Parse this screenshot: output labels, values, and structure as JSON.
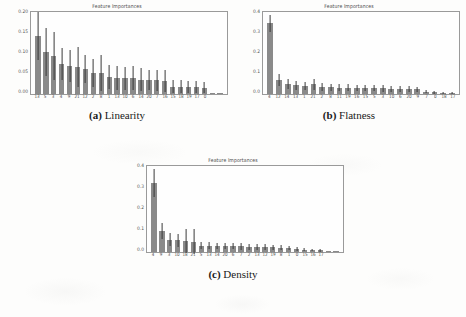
{
  "figure": {
    "background_color": "#fdfdfc",
    "bar_color": "#8a8a8a",
    "error_bar_color": "#3a3a3a",
    "axes_border_color": "#9a9a9a"
  },
  "panels": [
    {
      "id": "a",
      "caption_label": "(a)",
      "caption_text": "Linearity",
      "chart_data": {
        "type": "bar",
        "title": "Feature Importances",
        "xlabel": "",
        "ylabel": "",
        "ylim": [
          0.0,
          0.21
        ],
        "yticks": [
          "0.00",
          "0.05",
          "0.10",
          "0.15",
          "0.20"
        ],
        "ytick_values": [
          0.0,
          0.05,
          0.1,
          0.15,
          0.2
        ],
        "grid": false,
        "legend": "none",
        "categories": [
          "13",
          "5",
          "3",
          "4",
          "9",
          "21",
          "12",
          "2",
          "8",
          "1",
          "13",
          "10",
          "6",
          "14",
          "20",
          "7",
          "16",
          "15",
          "18",
          "19",
          "17",
          "0"
        ],
        "values": [
          0.148,
          0.107,
          0.098,
          0.076,
          0.072,
          0.07,
          0.063,
          0.055,
          0.054,
          0.044,
          0.042,
          0.04,
          0.04,
          0.037,
          0.036,
          0.035,
          0.034,
          0.019,
          0.019,
          0.018,
          0.018,
          0.016
        ],
        "errors": [
          0.06,
          0.06,
          0.06,
          0.04,
          0.04,
          0.05,
          0.035,
          0.035,
          0.045,
          0.03,
          0.03,
          0.028,
          0.03,
          0.028,
          0.026,
          0.026,
          0.028,
          0.016,
          0.016,
          0.016,
          0.016,
          0.014
        ],
        "tail_values": [
          0.002,
          0.002
        ]
      }
    },
    {
      "id": "b",
      "caption_label": "(b)",
      "caption_text": "Flatness",
      "chart_data": {
        "type": "bar",
        "title": "Feature Importances",
        "xlabel": "",
        "ylabel": "",
        "ylim": [
          0.0,
          0.43
        ],
        "yticks": [
          "0.0",
          "0.1",
          "0.2",
          "0.3",
          "0.4"
        ],
        "ytick_values": [
          0.0,
          0.1,
          0.2,
          0.3,
          0.4
        ],
        "grid": false,
        "legend": "none",
        "categories": [
          "4",
          "12",
          "14",
          "13",
          "1",
          "21",
          "2",
          "8",
          "11",
          "19",
          "16",
          "15",
          "5",
          "3",
          "10",
          "6",
          "20",
          "9",
          "7",
          "0",
          "18",
          "17"
        ],
        "values": [
          0.37,
          0.075,
          0.052,
          0.045,
          0.042,
          0.05,
          0.038,
          0.035,
          0.034,
          0.033,
          0.032,
          0.031,
          0.03,
          0.029,
          0.028,
          0.027,
          0.026,
          0.024,
          0.012,
          0.008,
          0.006,
          0.004
        ],
        "errors": [
          0.045,
          0.03,
          0.025,
          0.022,
          0.022,
          0.026,
          0.02,
          0.018,
          0.018,
          0.018,
          0.017,
          0.017,
          0.016,
          0.016,
          0.015,
          0.015,
          0.014,
          0.013,
          0.008,
          0.006,
          0.005,
          0.004
        ],
        "tail_values": []
      }
    },
    {
      "id": "c",
      "caption_label": "(c)",
      "caption_text": "Density",
      "chart_data": {
        "type": "bar",
        "title": "Feature Importances",
        "xlabel": "",
        "ylabel": "",
        "ylim": [
          0.0,
          0.43
        ],
        "yticks": [
          "0.0",
          "0.1",
          "0.2",
          "0.3",
          "0.4"
        ],
        "ytick_values": [
          0.0,
          0.1,
          0.2,
          0.3,
          0.4
        ],
        "grid": false,
        "legend": "none",
        "categories": [
          "4",
          "9",
          "3",
          "10",
          "18",
          "21",
          "5",
          "13",
          "14",
          "20",
          "6",
          "7",
          "2",
          "13",
          "12",
          "19",
          "8",
          "1",
          "0",
          "15",
          "16",
          "17"
        ],
        "values": [
          0.345,
          0.105,
          0.062,
          0.058,
          0.055,
          0.052,
          0.032,
          0.031,
          0.03,
          0.03,
          0.029,
          0.028,
          0.026,
          0.025,
          0.024,
          0.023,
          0.022,
          0.02,
          0.016,
          0.012,
          0.01,
          0.008
        ],
        "errors": [
          0.07,
          0.04,
          0.03,
          0.03,
          0.06,
          0.06,
          0.018,
          0.017,
          0.017,
          0.017,
          0.016,
          0.016,
          0.015,
          0.015,
          0.014,
          0.014,
          0.013,
          0.012,
          0.01,
          0.008,
          0.007,
          0.006
        ],
        "tail_values": [
          0.003,
          0.002
        ]
      }
    }
  ]
}
